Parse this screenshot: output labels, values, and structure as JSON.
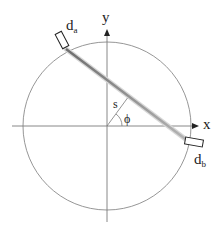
{
  "diagram": {
    "axes": {
      "x_label": "x",
      "y_label": "y"
    },
    "detectors": {
      "a": {
        "base": "d",
        "subscript": "a"
      },
      "b": {
        "base": "d",
        "subscript": "b"
      }
    },
    "parameters": {
      "distance_label": "s",
      "angle_label": "ϕ"
    },
    "colors": {
      "circle": "#8a8a8a",
      "axes": "#7a7a7a",
      "line_of_response": "#9a9a9a",
      "detector_stroke": "#222222",
      "text": "#222222"
    }
  }
}
